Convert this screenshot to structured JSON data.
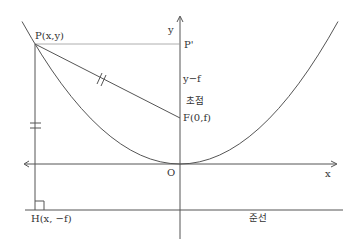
{
  "diagram": {
    "type": "parabola-focus-directrix",
    "colors": {
      "line": "#555555",
      "guide": "#999999",
      "text": "#333333",
      "background": "#ffffff"
    },
    "axes": {
      "x_label": "x",
      "y_label": "y",
      "origin_label": "O"
    },
    "points": {
      "P": "P(x,y)",
      "P_prime": "P'",
      "F": "F(0,f)",
      "H": "H(x, −f)"
    },
    "labels": {
      "segment_PP_prime_focus": "y−f",
      "focus_korean": "초점",
      "directrix_korean": "준선"
    },
    "marks": {
      "PF_equal_tick": "double tick",
      "PH_equal_tick": "double tick",
      "right_angle_at_H": true
    }
  }
}
